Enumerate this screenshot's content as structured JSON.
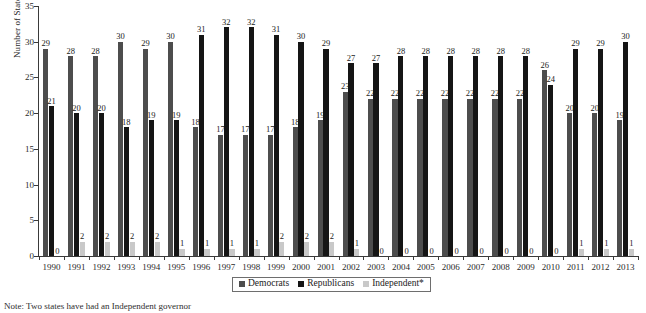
{
  "chart_data": {
    "type": "bar",
    "title": "",
    "xlabel": "",
    "ylabel": "Number of States",
    "ylim": [
      0,
      35
    ],
    "yticks": [
      0,
      5,
      10,
      15,
      20,
      25,
      30,
      35
    ],
    "grid": false,
    "legend_position": "bottom-center",
    "categories": [
      "1990",
      "1991",
      "1992",
      "1993",
      "1994",
      "1995",
      "1996",
      "1997",
      "1998",
      "1999",
      "2000",
      "2001",
      "2002",
      "2003",
      "2004",
      "2005",
      "2006",
      "2007",
      "2008",
      "2009",
      "2010",
      "2011",
      "2012",
      "2013"
    ],
    "series": [
      {
        "name": "Democrats",
        "color": "#4d4d4d",
        "values": [
          29,
          28,
          28,
          30,
          29,
          30,
          18,
          17,
          17,
          17,
          18,
          19,
          23,
          22,
          22,
          22,
          22,
          22,
          22,
          22,
          26,
          20,
          20,
          19
        ]
      },
      {
        "name": "Republicans",
        "color": "#151515",
        "values": [
          21,
          20,
          20,
          18,
          19,
          19,
          31,
          32,
          32,
          31,
          30,
          29,
          27,
          27,
          28,
          28,
          28,
          28,
          28,
          28,
          24,
          29,
          29,
          30
        ]
      },
      {
        "name": "Independent*",
        "color": "#c9c9c9",
        "values": [
          0,
          2,
          2,
          2,
          2,
          1,
          1,
          1,
          1,
          2,
          2,
          2,
          1,
          0,
          0,
          0,
          0,
          0,
          0,
          0,
          0,
          1,
          1,
          1
        ]
      }
    ]
  },
  "legend": {
    "items": [
      {
        "label": "Democrats",
        "color": "#4d4d4d"
      },
      {
        "label": "Republicans",
        "color": "#151515"
      },
      {
        "label": "Independent*",
        "color": "#c9c9c9"
      }
    ]
  },
  "footnote": {
    "text": "Note: Two states have had an Independent governor"
  }
}
